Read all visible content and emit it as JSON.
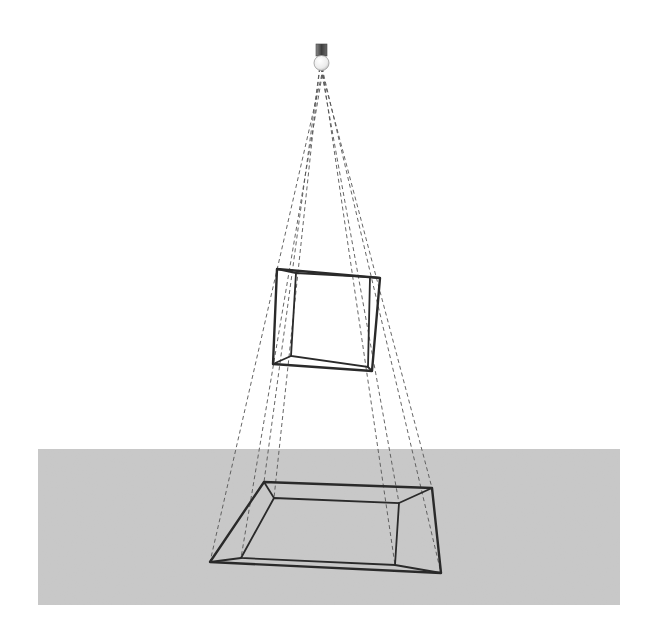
{
  "diagram": {
    "title": "",
    "elements": {
      "light_source": {
        "type": "bulb-with-cap",
        "icon": "light-bulb-icon"
      },
      "object": {
        "type": "square-frame",
        "label": ""
      },
      "shadow": {
        "type": "enlarged-frame-shadow",
        "label": ""
      },
      "ground": {
        "type": "plane",
        "label": ""
      }
    },
    "colors": {
      "ground": "#c9c9c9",
      "edges": "#2a2a2a",
      "rays": "#555555",
      "bulb": "#f4f4f4",
      "cap": "#5a5a5a"
    }
  }
}
